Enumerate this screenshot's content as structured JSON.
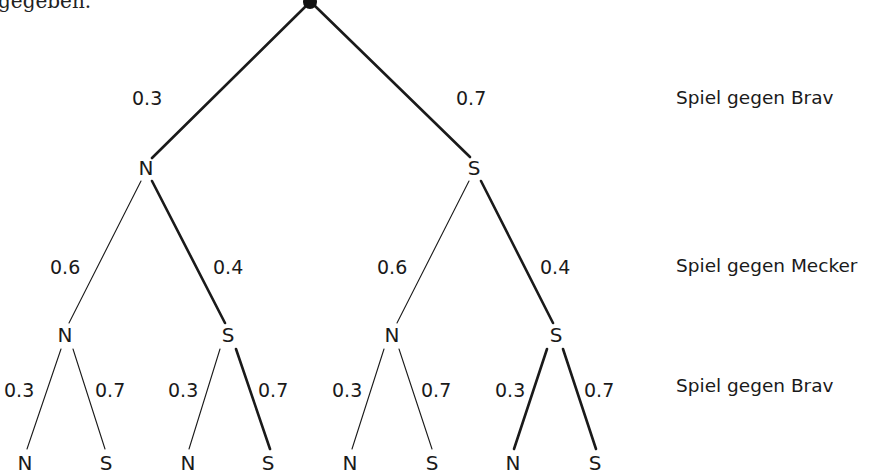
{
  "intro_text_fragment": "gegeben.",
  "levels": [
    {
      "label": "Spiel gegen Brav",
      "y": 98
    },
    {
      "label": "Spiel gegen Mecker",
      "y": 266
    },
    {
      "label": "Spiel gegen Brav",
      "y": 386
    }
  ],
  "root": {
    "x": 310,
    "y": 2
  },
  "nodes": {
    "l1": [
      {
        "label": "N",
        "x": 146,
        "y": 168
      },
      {
        "label": "S",
        "x": 474,
        "y": 168
      }
    ],
    "l2": [
      {
        "label": "N",
        "x": 65,
        "y": 335
      },
      {
        "label": "S",
        "x": 228,
        "y": 335
      },
      {
        "label": "N",
        "x": 392,
        "y": 335
      },
      {
        "label": "S",
        "x": 556,
        "y": 335
      }
    ],
    "l3": [
      {
        "label": "N",
        "x": 25,
        "y": 463
      },
      {
        "label": "S",
        "x": 106,
        "y": 463
      },
      {
        "label": "N",
        "x": 188,
        "y": 463
      },
      {
        "label": "S",
        "x": 268,
        "y": 463
      },
      {
        "label": "N",
        "x": 350,
        "y": 463
      },
      {
        "label": "S",
        "x": 432,
        "y": 463
      },
      {
        "label": "N",
        "x": 513,
        "y": 463
      },
      {
        "label": "S",
        "x": 595,
        "y": 463
      }
    ]
  },
  "edges": [
    {
      "x1": 306,
      "y1": 6,
      "x2": 152,
      "y2": 158,
      "prob": "0.3",
      "thick": true,
      "lx": 132,
      "ly": 89
    },
    {
      "x1": 315,
      "y1": 6,
      "x2": 470,
      "y2": 157,
      "prob": "0.7",
      "thick": true,
      "lx": 456,
      "ly": 89
    },
    {
      "x1": 141,
      "y1": 181,
      "x2": 69,
      "y2": 323,
      "prob": "0.6",
      "thick": false,
      "lx": 50,
      "ly": 258
    },
    {
      "x1": 152,
      "y1": 181,
      "x2": 225,
      "y2": 323,
      "prob": "0.4",
      "thick": true,
      "lx": 213,
      "ly": 258
    },
    {
      "x1": 469,
      "y1": 181,
      "x2": 397,
      "y2": 323,
      "prob": "0.6",
      "thick": false,
      "lx": 377,
      "ly": 258
    },
    {
      "x1": 481,
      "y1": 181,
      "x2": 553,
      "y2": 323,
      "prob": "0.4",
      "thick": true,
      "lx": 540,
      "ly": 258
    },
    {
      "x1": 61,
      "y1": 349,
      "x2": 27,
      "y2": 449,
      "prob": "0.3",
      "thick": false,
      "lx": 4,
      "ly": 381
    },
    {
      "x1": 73,
      "y1": 349,
      "x2": 105,
      "y2": 449,
      "prob": "0.7",
      "thick": false,
      "lx": 95,
      "ly": 381
    },
    {
      "x1": 220,
      "y1": 349,
      "x2": 189,
      "y2": 449,
      "prob": "0.3",
      "thick": false,
      "lx": 168,
      "ly": 381
    },
    {
      "x1": 236,
      "y1": 349,
      "x2": 270,
      "y2": 449,
      "prob": "0.7",
      "thick": true,
      "lx": 258,
      "ly": 381
    },
    {
      "x1": 384,
      "y1": 349,
      "x2": 352,
      "y2": 449,
      "prob": "0.3",
      "thick": false,
      "lx": 332,
      "ly": 381
    },
    {
      "x1": 399,
      "y1": 349,
      "x2": 432,
      "y2": 449,
      "prob": "0.7",
      "thick": false,
      "lx": 421,
      "ly": 381
    },
    {
      "x1": 547,
      "y1": 349,
      "x2": 514,
      "y2": 449,
      "prob": "0.3",
      "thick": true,
      "lx": 495,
      "ly": 381
    },
    {
      "x1": 563,
      "y1": 349,
      "x2": 596,
      "y2": 449,
      "prob": "0.7",
      "thick": true,
      "lx": 584,
      "ly": 381
    }
  ],
  "colors": {
    "line": "#1a1a1a",
    "text": "#1a1a1a",
    "background": "#ffffff"
  }
}
